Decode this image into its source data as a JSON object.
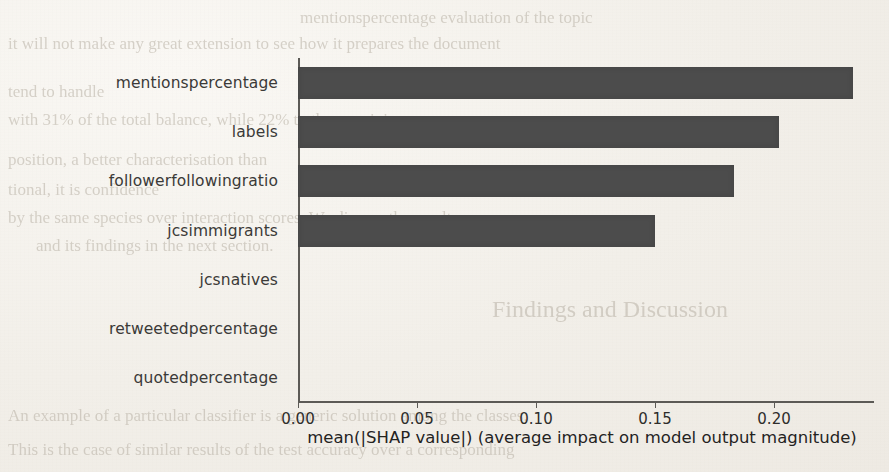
{
  "page": {
    "background_color": "#f2efe9",
    "ghost_text": [
      {
        "text": "it will not make any great extension to see how it prepares the document",
        "x": 8,
        "y": 34,
        "size": 17,
        "mirror": false
      },
      {
        "text": "tend to handle",
        "x": 8,
        "y": 82,
        "size": 17,
        "mirror": false
      },
      {
        "text": "with 31% of the total balance, while 22% to the remaining",
        "x": 8,
        "y": 110,
        "size": 17,
        "mirror": false
      },
      {
        "text": "position, a better characterisation than",
        "x": 8,
        "y": 150,
        "size": 17,
        "mirror": false
      },
      {
        "text": "tional, it is confidence",
        "x": 8,
        "y": 180,
        "size": 17,
        "mirror": false
      },
      {
        "text": "by the same species over interaction scores. We discuss the results",
        "x": 8,
        "y": 208,
        "size": 17,
        "mirror": false
      },
      {
        "text": "and its findings in the next section.",
        "x": 36,
        "y": 236,
        "size": 17,
        "mirror": false
      },
      {
        "text": "Findings and Discussion",
        "x": 492,
        "y": 296,
        "size": 24,
        "mirror": false
      },
      {
        "text": "An example of a particular classifier is a generic solution among the classes.",
        "x": 8,
        "y": 406,
        "size": 17,
        "mirror": false
      },
      {
        "text": "This is the case of similar results of the test accuracy over a corresponding",
        "x": 8,
        "y": 440,
        "size": 17,
        "mirror": false
      },
      {
        "text": "mentionspercentage evaluation of the topic",
        "x": 300,
        "y": 8,
        "size": 17,
        "mirror": false
      }
    ]
  },
  "chart_data": {
    "type": "bar",
    "orientation": "horizontal",
    "title": "",
    "xlabel": "mean(|SHAP value|) (average impact on model output magnitude)",
    "ylabel": "",
    "categories": [
      "mentionspercentage",
      "labels",
      "followerfollowingratio",
      "jcsimmigrants",
      "jcsnatives",
      "retweetedpercentage",
      "quotedpercentage"
    ],
    "values": [
      0.233,
      0.202,
      0.183,
      0.15,
      0.0,
      0.0,
      0.0
    ],
    "xticks": [
      0.0,
      0.05,
      0.1,
      0.15,
      0.2
    ],
    "xtick_labels": [
      "0.00",
      "0.05",
      "0.10",
      "0.15",
      "0.20"
    ],
    "xlim": [
      0.0,
      0.242
    ],
    "grid": false,
    "legend": false,
    "bar_color": "#4c4c4c",
    "axis_color": "#5c5a56"
  }
}
